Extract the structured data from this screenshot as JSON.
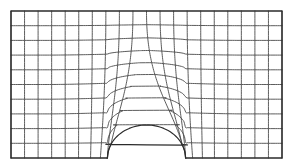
{
  "figure": {
    "kind": "finite-element-mesh",
    "background_color": "#ffffff",
    "line_color": "#4a4a4a",
    "boundary_color": "#2b2b2b",
    "line_width": 0.9,
    "boundary_width": 1.15
  },
  "chart_data": {
    "type": "mesh",
    "subtitle": "",
    "xlabel": "",
    "ylabel": "",
    "grid": true,
    "legend": false,
    "legend_position": "none",
    "domain": {
      "x0": 11,
      "y0": 11,
      "x1": 282,
      "y1": 158,
      "width": 271,
      "height": 147
    },
    "counts": {
      "columns": 20,
      "rows": 10,
      "nodes_nominal": 231,
      "elements_nominal": 200
    },
    "notch": {
      "shape": "semicircle",
      "center_x": 146.5,
      "center_y": 158,
      "radius_x": 39,
      "radius_y": 33,
      "left_x": 107.5,
      "right_x": 185.5,
      "apex_y": 125,
      "base_y": 158
    },
    "blend": {
      "influence_half_width": 78,
      "vertical_falloff_power": 2.1,
      "horizontal_falloff_power": 1.55
    },
    "axis_ranges": {
      "xlim": [
        11,
        282
      ],
      "ylim": [
        11,
        158
      ]
    }
  }
}
